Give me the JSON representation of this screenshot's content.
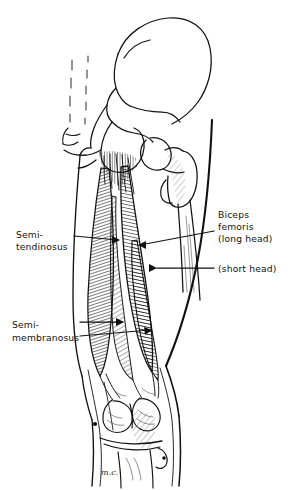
{
  "figure": {
    "medium": "pen-and-ink line drawing",
    "background_color": "#ffffff",
    "ink_color": "#111111",
    "signature": "m.c."
  },
  "labels": [
    {
      "id": "semitendinosus",
      "lines": [
        "Semi-",
        "tendinosus"
      ],
      "side": "left",
      "text_x": 16,
      "text_y": 238,
      "leader": {
        "from_x": 74,
        "from_y": 236,
        "to_x": 120,
        "to_y": 240
      }
    },
    {
      "id": "biceps-femoris-long-head",
      "lines": [
        "Biceps",
        "femoris",
        "(long head)"
      ],
      "side": "right",
      "text_x": 218,
      "text_y": 218,
      "leader": {
        "from_x": 214,
        "from_y": 231,
        "to_x": 138,
        "to_y": 245
      }
    },
    {
      "id": "biceps-femoris-short-head",
      "lines": [
        "(short head)"
      ],
      "side": "right",
      "text_x": 218,
      "text_y": 272,
      "leader": {
        "from_x": 214,
        "from_y": 268,
        "to_x": 155,
        "to_y": 268
      }
    },
    {
      "id": "semimembranosus",
      "lines": [
        "Semi-",
        "membranosus"
      ],
      "side": "left",
      "text_x": 12,
      "text_y": 328,
      "leader_a": {
        "from_x": 80,
        "from_y": 322,
        "to_x": 122,
        "to_y": 322
      },
      "leader_b": {
        "from_x": 80,
        "from_y": 336,
        "to_x": 148,
        "to_y": 330
      }
    }
  ],
  "structures": [
    {
      "id": "ilium",
      "name": "ilium"
    },
    {
      "id": "sacrum",
      "name": "sacrum"
    },
    {
      "id": "coccyx",
      "name": "coccyx"
    },
    {
      "id": "ischium",
      "name": "ischial tuberosity"
    },
    {
      "id": "femoral-head",
      "name": "head of femur"
    },
    {
      "id": "greater-troch",
      "name": "greater trochanter"
    },
    {
      "id": "femur-shaft",
      "name": "femoral shaft"
    },
    {
      "id": "thigh-medial",
      "name": "medial thigh contour"
    },
    {
      "id": "thigh-lateral",
      "name": "lateral thigh contour"
    },
    {
      "id": "knee",
      "name": "knee joint / popliteal fossa"
    },
    {
      "id": "femoral-condyles",
      "name": "femoral condyles"
    },
    {
      "id": "tibia",
      "name": "tibia"
    },
    {
      "id": "calf",
      "name": "proximal calf"
    }
  ]
}
